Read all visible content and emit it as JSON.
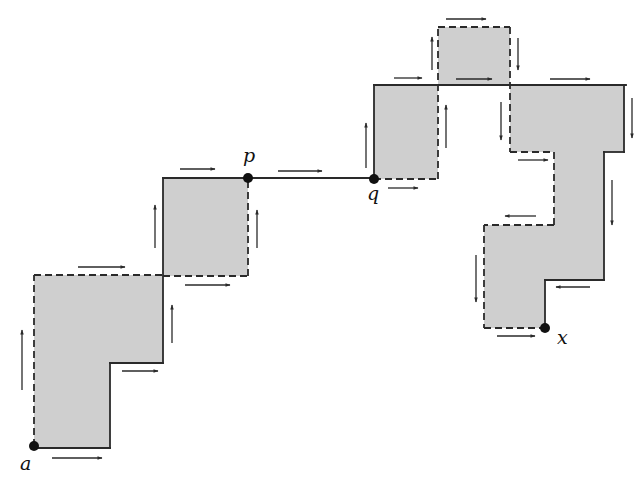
{
  "colors": {
    "fill": "#cfcfcf",
    "stroke": "#2a2a2a",
    "background": "#ffffff"
  },
  "regions": [
    {
      "id": "region-1",
      "points": [
        [
          34,
          446
        ],
        [
          34,
          275
        ],
        [
          163,
          275
        ],
        [
          163,
          363
        ],
        [
          110,
          363
        ],
        [
          110,
          448
        ],
        [
          34,
          448
        ]
      ]
    },
    {
      "id": "region-2",
      "points": [
        [
          163,
          178
        ],
        [
          248,
          178
        ],
        [
          248,
          276
        ],
        [
          163,
          276
        ]
      ]
    },
    {
      "id": "region-3",
      "points": [
        [
          374,
          85
        ],
        [
          438,
          85
        ],
        [
          438,
          179
        ],
        [
          374,
          179
        ]
      ]
    },
    {
      "id": "region-4",
      "points": [
        [
          438,
          27
        ],
        [
          510,
          27
        ],
        [
          510,
          85
        ],
        [
          438,
          85
        ]
      ]
    },
    {
      "id": "region-5",
      "points": [
        [
          510,
          85
        ],
        [
          624,
          85
        ],
        [
          624,
          152
        ],
        [
          604,
          152
        ],
        [
          604,
          280
        ],
        [
          545,
          280
        ],
        [
          545,
          328
        ],
        [
          484,
          328
        ],
        [
          484,
          225
        ],
        [
          554,
          225
        ],
        [
          554,
          152
        ],
        [
          510,
          152
        ]
      ]
    }
  ],
  "solid_edges": [
    [
      [
        34,
        448
      ],
      [
        110,
        448
      ]
    ],
    [
      [
        110,
        448
      ],
      [
        110,
        363
      ]
    ],
    [
      [
        110,
        363
      ],
      [
        163,
        363
      ]
    ],
    [
      [
        163,
        363
      ],
      [
        163,
        178
      ]
    ],
    [
      [
        163,
        178
      ],
      [
        248,
        178
      ]
    ],
    [
      [
        248,
        178
      ],
      [
        374,
        178
      ]
    ],
    [
      [
        374,
        178
      ],
      [
        374,
        85
      ]
    ],
    [
      [
        374,
        85
      ],
      [
        438,
        85
      ]
    ],
    [
      [
        438,
        85
      ],
      [
        626,
        85
      ]
    ],
    [
      [
        624,
        85
      ],
      [
        624,
        152
      ]
    ],
    [
      [
        624,
        152
      ],
      [
        604,
        152
      ]
    ],
    [
      [
        604,
        152
      ],
      [
        604,
        280
      ]
    ],
    [
      [
        604,
        280
      ],
      [
        545,
        280
      ]
    ],
    [
      [
        545,
        280
      ],
      [
        545,
        328
      ]
    ]
  ],
  "dashed_edges": [
    [
      [
        34,
        446
      ],
      [
        34,
        275
      ]
    ],
    [
      [
        34,
        275
      ],
      [
        163,
        275
      ]
    ],
    [
      [
        163,
        276
      ],
      [
        248,
        276
      ]
    ],
    [
      [
        248,
        276
      ],
      [
        248,
        178
      ]
    ],
    [
      [
        374,
        179
      ],
      [
        438,
        179
      ]
    ],
    [
      [
        438,
        179
      ],
      [
        438,
        27
      ]
    ],
    [
      [
        438,
        27
      ],
      [
        510,
        27
      ]
    ],
    [
      [
        510,
        27
      ],
      [
        510,
        152
      ]
    ],
    [
      [
        510,
        152
      ],
      [
        554,
        152
      ]
    ],
    [
      [
        554,
        152
      ],
      [
        554,
        225
      ]
    ],
    [
      [
        554,
        225
      ],
      [
        484,
        225
      ]
    ],
    [
      [
        484,
        225
      ],
      [
        484,
        328
      ]
    ],
    [
      [
        484,
        328
      ],
      [
        545,
        328
      ]
    ]
  ],
  "arrows": [
    {
      "from": [
        52,
        458
      ],
      "to": [
        102,
        458
      ]
    },
    {
      "from": [
        22,
        390
      ],
      "to": [
        22,
        330
      ]
    },
    {
      "from": [
        78,
        267
      ],
      "to": [
        125,
        267
      ]
    },
    {
      "from": [
        122,
        371
      ],
      "to": [
        158,
        371
      ]
    },
    {
      "from": [
        172,
        343
      ],
      "to": [
        172,
        305
      ]
    },
    {
      "from": [
        155,
        248
      ],
      "to": [
        155,
        205
      ]
    },
    {
      "from": [
        180,
        169
      ],
      "to": [
        215,
        169
      ]
    },
    {
      "from": [
        185,
        285
      ],
      "to": [
        230,
        285
      ]
    },
    {
      "from": [
        257,
        248
      ],
      "to": [
        257,
        210
      ]
    },
    {
      "from": [
        278,
        171
      ],
      "to": [
        322,
        171
      ]
    },
    {
      "from": [
        366,
        168
      ],
      "to": [
        366,
        123
      ]
    },
    {
      "from": [
        388,
        188
      ],
      "to": [
        418,
        188
      ]
    },
    {
      "from": [
        394,
        78
      ],
      "to": [
        422,
        78
      ]
    },
    {
      "from": [
        432,
        70
      ],
      "to": [
        432,
        37
      ]
    },
    {
      "from": [
        446,
        19
      ],
      "to": [
        486,
        19
      ]
    },
    {
      "from": [
        456,
        79
      ],
      "to": [
        492,
        79
      ]
    },
    {
      "from": [
        518,
        38
      ],
      "to": [
        518,
        70
      ]
    },
    {
      "from": [
        446,
        148
      ],
      "to": [
        446,
        105
      ]
    },
    {
      "from": [
        501,
        102
      ],
      "to": [
        501,
        140
      ]
    },
    {
      "from": [
        550,
        79
      ],
      "to": [
        590,
        79
      ]
    },
    {
      "from": [
        632,
        98
      ],
      "to": [
        632,
        138
      ]
    },
    {
      "from": [
        518,
        160
      ],
      "to": [
        548,
        160
      ]
    },
    {
      "from": [
        612,
        180
      ],
      "to": [
        612,
        225
      ]
    },
    {
      "from": [
        536,
        216
      ],
      "to": [
        505,
        216
      ]
    },
    {
      "from": [
        476,
        255
      ],
      "to": [
        476,
        302
      ]
    },
    {
      "from": [
        590,
        287
      ],
      "to": [
        556,
        287
      ]
    },
    {
      "from": [
        497,
        336
      ],
      "to": [
        535,
        336
      ]
    }
  ],
  "points": [
    {
      "name": "a",
      "x": 34,
      "y": 446,
      "label_x": 20,
      "label_y": 470
    },
    {
      "name": "p",
      "x": 248,
      "y": 178,
      "label_x": 243,
      "label_y": 162
    },
    {
      "name": "q",
      "x": 374,
      "y": 179,
      "label_x": 367,
      "label_y": 200
    },
    {
      "name": "x",
      "x": 545,
      "y": 328,
      "label_x": 557,
      "label_y": 344
    }
  ]
}
